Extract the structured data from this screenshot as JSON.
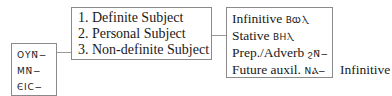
{
  "subject_forms": [
    "ΟΥΝ̄−",
    "ΜΝ̄−",
    "ЄΙС−"
  ],
  "subject_types": [
    "1. Definite Subject",
    "2. Personal Subject",
    "3. Non-definite Subject"
  ],
  "predicate_types": [
    {
      "label": "Infinitive",
      "coptic": "ΒⲰⲖ"
    },
    {
      "label": "Stative",
      "coptic": "ΒΗⲖ"
    },
    {
      "label": "Prep./Adverb",
      "coptic": "ϩΝ̄−"
    },
    {
      "label": "Future auxil.",
      "coptic": "ΝⲀ−"
    }
  ],
  "future_auxil_followed_by": "Infinitive"
}
